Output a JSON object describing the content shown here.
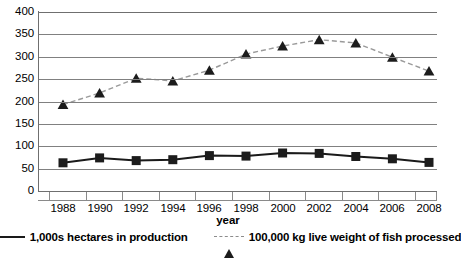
{
  "chart_data": {
    "type": "line",
    "title": "",
    "xlabel": "year",
    "ylabel": "",
    "ylim": [
      0,
      400
    ],
    "ytick_step": 50,
    "yticks": [
      "0",
      "50",
      "100",
      "150",
      "200",
      "250",
      "300",
      "350",
      "400"
    ],
    "grid": true,
    "legend_position": "bottom",
    "categories": [
      1988,
      1990,
      1992,
      1994,
      1996,
      1998,
      2000,
      2002,
      2004,
      2006,
      2008
    ],
    "xtick_labels": [
      "1988",
      "1990",
      "1992",
      "1994",
      "1996",
      "1998",
      "2000",
      "2002",
      "2004",
      "2006",
      "2008"
    ],
    "series": [
      {
        "name": "1,000s hectares in production",
        "marker": "square",
        "line_style": "solid",
        "color": "#1c1c1c",
        "line_color": "#1a1a1a",
        "values": [
          63,
          74,
          68,
          70,
          79,
          78,
          85,
          84,
          77,
          72,
          64
        ]
      },
      {
        "name": "100,000 kg live weight of fish processed",
        "marker": "triangle",
        "line_style": "dashed",
        "color": "#1c1c1c",
        "line_color": "#9a9a9a",
        "values": [
          193,
          219,
          252,
          246,
          270,
          306,
          324,
          338,
          331,
          299,
          268
        ]
      }
    ]
  },
  "legend": {
    "items": [
      {
        "label": "1,000s hectares in production"
      },
      {
        "label": "100,000 kg live weight of fish processed"
      }
    ]
  },
  "axis": {
    "x_title": "year"
  },
  "colors": {
    "gridline": "#808080",
    "axis": "#6f6f6f",
    "series1": "#1c1c1c",
    "series2": "#9a9a9a",
    "background": "#ffffff"
  }
}
